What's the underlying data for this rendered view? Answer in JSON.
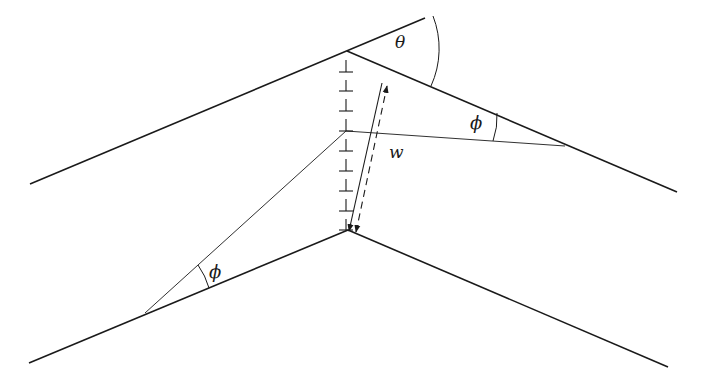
{
  "diagram": {
    "type": "geometry",
    "colors": {
      "stroke": "#1a1a1a",
      "background": "#ffffff"
    },
    "labels": {
      "theta": "θ",
      "phi_upper": "ϕ",
      "phi_lower": "ϕ",
      "width": "w"
    },
    "upper_chevron": {
      "left_line": {
        "x1": 30,
        "y1": 184,
        "x2": 425,
        "y2": 18
      },
      "right_line": {
        "x1": 347,
        "y1": 51,
        "x2": 677,
        "y2": 192
      },
      "apex": {
        "x": 347,
        "y": 51
      }
    },
    "lower_chevron": {
      "left_line": {
        "x1": 29,
        "y1": 363,
        "x2": 348,
        "y2": 230
      },
      "right_line": {
        "x1": 348,
        "y1": 230,
        "x2": 668,
        "y2": 367
      },
      "apex": {
        "x": 348,
        "y": 230
      }
    },
    "axis_ticks_y": [
      70,
      90,
      110,
      131,
      151,
      171,
      191,
      211,
      230
    ],
    "axis_x": 346,
    "rays": [
      {
        "name": "ray-to-upper-right",
        "x1": 346,
        "y1": 131,
        "x2": 565,
        "y2": 146
      },
      {
        "name": "ray-to-lower-left",
        "x1": 346,
        "y1": 131,
        "x2": 145,
        "y2": 313
      }
    ],
    "dimension_w": {
      "solid": {
        "x1": 351,
        "y1": 231,
        "x2": 382,
        "y2": 84
      },
      "dashed": {
        "x1": 358,
        "y1": 232,
        "x2": 389,
        "y2": 86
      }
    }
  }
}
